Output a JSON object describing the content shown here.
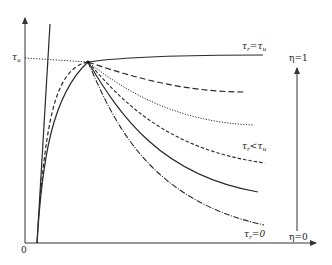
{
  "figure": {
    "type": "stress-slip diagram",
    "axes": {
      "y_tick_label": "τ",
      "y_tick_sub": "u",
      "origin_label": "0"
    },
    "curves": [
      {
        "id": "curve-tr-eq-tu",
        "label_main": "τ",
        "label_sub": "r",
        "label_rel": "=τ",
        "label_rel_sub": "u",
        "style": "solid"
      },
      {
        "id": "curve-long-dash",
        "style": "long-dash"
      },
      {
        "id": "curve-dotted",
        "style": "dotted"
      },
      {
        "id": "curve-tr-lt-tu",
        "label_main": "τ",
        "label_sub": "r",
        "label_rel": "<τ",
        "label_rel_sub": "u",
        "style": "short-dash"
      },
      {
        "id": "curve-solid-lower",
        "style": "solid"
      },
      {
        "id": "curve-tr-eq-0",
        "label_main": "τ",
        "label_sub": "r",
        "label_rel": "=0",
        "style": "dash-dot"
      }
    ],
    "eta_arrow": {
      "top_label": "η=1",
      "bottom_label": "η=0"
    },
    "colors": {
      "line": "#2a2a2a",
      "axis": "#333333",
      "background": "#ffffff"
    }
  }
}
